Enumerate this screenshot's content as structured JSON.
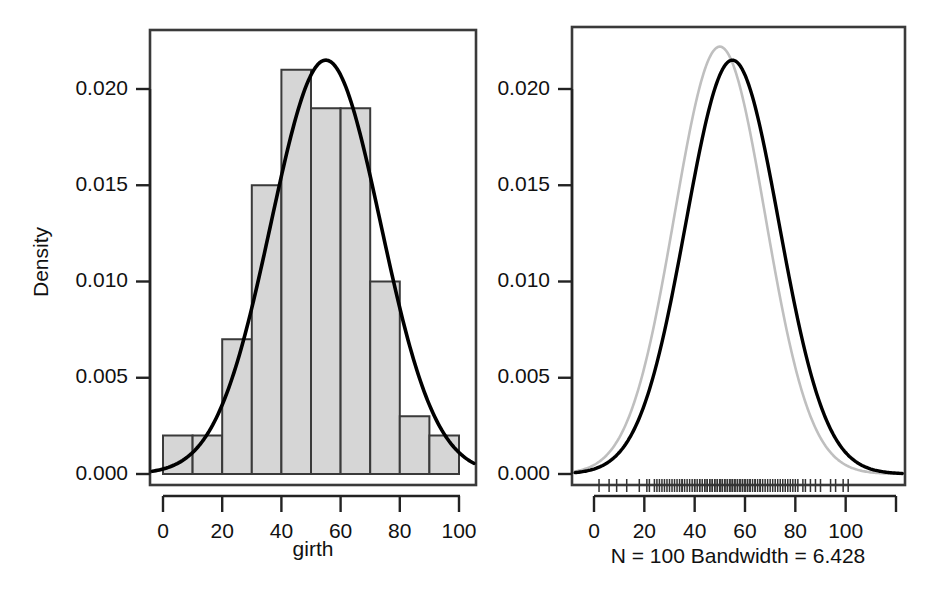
{
  "figure": {
    "type": "statistical-figure",
    "background": "#ffffff",
    "panel_count": 2
  },
  "chart_data": [
    {
      "id": "left-panel",
      "type": "bar",
      "title": "",
      "subtitle": "",
      "xlabel": "girth",
      "ylabel": "Density",
      "grid": false,
      "legend": "none",
      "xlim": [
        -5,
        110
      ],
      "ylim": [
        0.0,
        0.0225
      ],
      "xticks": [
        0,
        20,
        40,
        60,
        80,
        100
      ],
      "xtick_labels": [
        "0",
        "20",
        "40",
        "60",
        "80",
        "100"
      ],
      "yticks": [
        0.0,
        0.005,
        0.01,
        0.015,
        0.02
      ],
      "ytick_labels": [
        "0.000",
        "0.005",
        "0.010",
        "0.015",
        "0.020"
      ],
      "bin_width": 10,
      "bin_edges": [
        0,
        10,
        20,
        30,
        40,
        50,
        60,
        70,
        80,
        90,
        100
      ],
      "categories": [
        "0-10",
        "10-20",
        "20-30",
        "30-40",
        "40-50",
        "50-60",
        "60-70",
        "70-80",
        "80-90",
        "90-100"
      ],
      "values": [
        0.002,
        0.002,
        0.007,
        0.015,
        0.021,
        0.019,
        0.019,
        0.01,
        0.003,
        0.002
      ],
      "bar_fill": "#d6d6d6",
      "bar_stroke": "#3a3a3a",
      "overlay_curve": {
        "name": "normal-density",
        "color": "#000000",
        "mean": 55,
        "sd": 18.5,
        "peak_x": 55,
        "peak_y": 0.0215
      }
    },
    {
      "id": "right-panel",
      "type": "line",
      "title": "",
      "subtitle": "N = 100   Bandwidth = 6.428",
      "xlabel": "",
      "ylabel": "",
      "grid": false,
      "legend": "none",
      "xlim": [
        -15,
        125
      ],
      "ylim": [
        0.0,
        0.0225
      ],
      "xticks": [
        0,
        20,
        40,
        60,
        80,
        100,
        120
      ],
      "xtick_labels": [
        "0",
        "20",
        "40",
        "60",
        "80",
        "100",
        ""
      ],
      "yticks": [
        0.0,
        0.005,
        0.01,
        0.015,
        0.02
      ],
      "ytick_labels": [
        "0.000",
        "0.005",
        "0.010",
        "0.015",
        "0.020"
      ],
      "series": [
        {
          "name": "kernel-density-estimate",
          "color": "#000000",
          "width": 3.4,
          "mean": 55,
          "sd": 18.5,
          "peak_x": 55,
          "peak_y": 0.0215
        },
        {
          "name": "normal-reference-density",
          "color": "#bfbfbf",
          "width": 2.6,
          "mean": 50,
          "sd": 18.0,
          "peak_x": 50,
          "peak_y": 0.0222
        }
      ],
      "rug": {
        "name": "rug-plot",
        "n": 100,
        "color": "#333333",
        "values": [
          2,
          6,
          9,
          13,
          18,
          21,
          22,
          24,
          25,
          26,
          27,
          28,
          29,
          30,
          31,
          32,
          33,
          34,
          35,
          35,
          36,
          37,
          38,
          39,
          40,
          40,
          41,
          42,
          42,
          43,
          44,
          44,
          45,
          45,
          46,
          46,
          47,
          47,
          48,
          48,
          49,
          49,
          50,
          50,
          50,
          51,
          51,
          52,
          52,
          53,
          53,
          54,
          54,
          55,
          55,
          55,
          56,
          56,
          57,
          57,
          58,
          58,
          59,
          59,
          60,
          60,
          61,
          61,
          62,
          62,
          63,
          64,
          64,
          65,
          66,
          66,
          67,
          68,
          69,
          70,
          71,
          72,
          73,
          74,
          75,
          76,
          77,
          78,
          79,
          80,
          81,
          83,
          84,
          86,
          88,
          90,
          94,
          96,
          99,
          101
        ]
      },
      "annotations": {
        "n_label": "N = 100",
        "bandwidth_label": "Bandwidth = 6.428"
      }
    }
  ],
  "left_panel": {
    "axis_title_y": "Density",
    "axis_title_x": "girth"
  },
  "right_panel": {
    "caption": "N = 100   Bandwidth = 6.428"
  }
}
